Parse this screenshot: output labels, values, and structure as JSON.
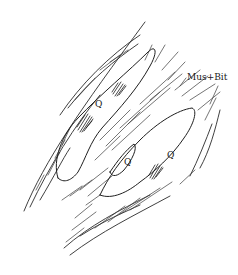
{
  "figure": {
    "type": "petrographic-sketch",
    "labels": {
      "mus_bit": {
        "text": "Mus+Bit",
        "x": 187,
        "y": 73,
        "size": 9
      },
      "q1": {
        "text": "Q",
        "x": 95,
        "y": 100,
        "size": 9
      },
      "q2": {
        "text": "Q",
        "x": 124,
        "y": 158,
        "size": 9
      },
      "q3": {
        "text": "Q",
        "x": 167,
        "y": 151,
        "size": 9
      }
    },
    "colors": {
      "ink": "#1f1f1f",
      "background": "#ffffff"
    }
  }
}
